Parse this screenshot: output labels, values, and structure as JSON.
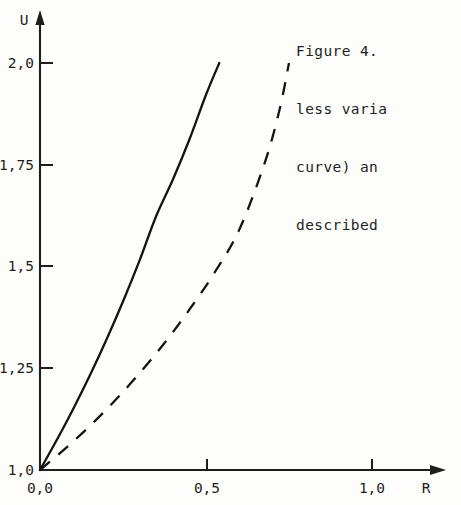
{
  "caption": {
    "lines": [
      "Figure 4.",
      "less varia",
      "curve) an",
      "described"
    ],
    "note": "text clipped at right page edge"
  },
  "axes": {
    "y_axis_label": "U",
    "x_axis_label": "R",
    "y_tick_labels": [
      "2,0",
      "1,75",
      "1,5",
      "1,25",
      "1,0"
    ],
    "x_tick_labels": [
      "0,0",
      "0,5",
      "1,0"
    ],
    "decimal_separator": ","
  },
  "colors": {
    "ink": "#1d1d1d",
    "curve": "#141414",
    "paper": "#fdfdfc"
  },
  "chart_data": {
    "type": "line",
    "title": "Figure 4.",
    "xlabel": "R",
    "ylabel": "U",
    "xlim": [
      0.0,
      1.18
    ],
    "ylim": [
      1.0,
      2.05
    ],
    "xticks": [
      0.0,
      0.5,
      1.0
    ],
    "xtick_labels": [
      "0,0",
      "0,5",
      "1,0"
    ],
    "yticks": [
      1.0,
      1.25,
      1.5,
      1.75,
      2.0
    ],
    "ytick_labels": [
      "1,0",
      "1,25",
      "1,5",
      "1,75",
      "2,0"
    ],
    "grid": false,
    "legend": null,
    "axis_style": "arrow-tipped half axes",
    "series": [
      {
        "name": "solid curve",
        "style": "solid",
        "points": [
          [
            0.0,
            1.0
          ],
          [
            0.05,
            1.073
          ],
          [
            0.1,
            1.15
          ],
          [
            0.15,
            1.232
          ],
          [
            0.2,
            1.32
          ],
          [
            0.25,
            1.414
          ],
          [
            0.3,
            1.515
          ],
          [
            0.35,
            1.624
          ],
          [
            0.4,
            1.713
          ],
          [
            0.45,
            1.812
          ],
          [
            0.5,
            1.922
          ],
          [
            0.54,
            2.0
          ]
        ]
      },
      {
        "name": "dashed curve",
        "style": "dashed",
        "points": [
          [
            0.0,
            1.0
          ],
          [
            0.075,
            1.052
          ],
          [
            0.15,
            1.108
          ],
          [
            0.225,
            1.17
          ],
          [
            0.3,
            1.238
          ],
          [
            0.375,
            1.312
          ],
          [
            0.45,
            1.394
          ],
          [
            0.525,
            1.484
          ],
          [
            0.6,
            1.59
          ],
          [
            0.675,
            1.75
          ],
          [
            0.72,
            1.88
          ],
          [
            0.75,
            2.0
          ]
        ]
      }
    ]
  }
}
